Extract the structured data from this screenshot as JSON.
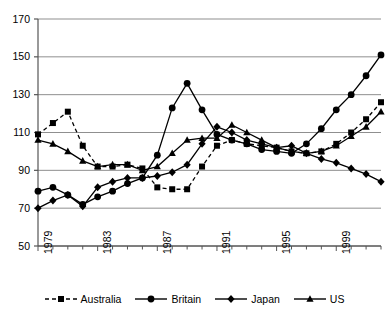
{
  "chart_data": {
    "type": "line",
    "title": "",
    "subtitle": "",
    "xlabel": "",
    "ylabel": "",
    "xlim": [
      1979,
      2002
    ],
    "ylim": [
      50,
      170
    ],
    "yticks": [
      50,
      70,
      90,
      110,
      130,
      150,
      170
    ],
    "xticks": [
      1979,
      1983,
      1987,
      1991,
      1995,
      1999
    ],
    "xtick_labels": [
      "1979",
      "1983",
      "1987",
      "1991",
      "1995",
      "1999"
    ],
    "ytick_labels": [
      "50",
      "70",
      "90",
      "110",
      "130",
      "150",
      "170"
    ],
    "x": [
      1979,
      1980,
      1981,
      1982,
      1983,
      1984,
      1985,
      1986,
      1987,
      1988,
      1989,
      1990,
      1991,
      1992,
      1993,
      1994,
      1995,
      1996,
      1997,
      1998,
      1999,
      2000,
      2001,
      2002
    ],
    "grid": "horizontal",
    "legend_position": "bottom",
    "series": [
      {
        "name": "Australia",
        "marker": "square",
        "dash": true,
        "color": "#000000",
        "values": [
          109,
          115,
          121,
          103,
          92,
          92,
          93,
          91,
          81,
          80,
          80,
          92,
          103,
          106,
          104,
          103,
          102,
          100,
          99,
          100,
          104,
          110,
          117,
          126
        ]
      },
      {
        "name": "Britain",
        "marker": "circle",
        "dash": false,
        "color": "#000000",
        "values": [
          79,
          81,
          77,
          72,
          76,
          79,
          83,
          86,
          98,
          123,
          136,
          122,
          109,
          106,
          104,
          101,
          100,
          99,
          104,
          112,
          122,
          130,
          140,
          151
        ]
      },
      {
        "name": "Japan",
        "marker": "diamond",
        "dash": false,
        "color": "#000000",
        "values": [
          70,
          74,
          77,
          71,
          81,
          84,
          86,
          86,
          87,
          89,
          93,
          104,
          113,
          110,
          106,
          104,
          102,
          103,
          99,
          96,
          94,
          91,
          88,
          84
        ]
      },
      {
        "name": "US",
        "marker": "triangle",
        "dash": false,
        "color": "#000000",
        "values": [
          106,
          104,
          100,
          95,
          92,
          93,
          93,
          90,
          92,
          99,
          106,
          107,
          107,
          114,
          110,
          106,
          102,
          100,
          99,
          100,
          103,
          108,
          113,
          121
        ]
      }
    ]
  },
  "axes": {
    "y_axis_name": "value-axis",
    "x_axis_name": "year-axis"
  },
  "legend": {
    "items": [
      {
        "label": "Australia",
        "marker": "square",
        "dash": true
      },
      {
        "label": "Britain",
        "marker": "circle",
        "dash": false
      },
      {
        "label": "Japan",
        "marker": "diamond",
        "dash": false
      },
      {
        "label": "US",
        "marker": "triangle",
        "dash": false
      }
    ]
  }
}
